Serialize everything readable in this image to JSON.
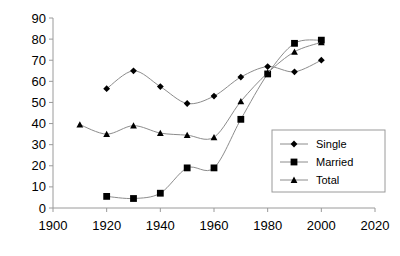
{
  "chart_data": {
    "type": "line",
    "title": "",
    "xlabel": "",
    "ylabel": "",
    "xlim": [
      1900,
      2020
    ],
    "ylim": [
      0,
      90
    ],
    "xticks": [
      1900,
      1920,
      1940,
      1960,
      1980,
      2000,
      2020
    ],
    "yticks": [
      0,
      10,
      20,
      30,
      40,
      50,
      60,
      70,
      80,
      90
    ],
    "xtick_labels": [
      "1900",
      "1920",
      "1940",
      "1960",
      "1980",
      "2000",
      "2020"
    ],
    "ytick_labels": [
      "0",
      "10",
      "20",
      "30",
      "40",
      "50",
      "60",
      "70",
      "80",
      "90"
    ],
    "grid": false,
    "legend_position": "center-right",
    "series": [
      {
        "name": "Single",
        "marker": "diamond",
        "x": [
          1920,
          1930,
          1940,
          1950,
          1960,
          1970,
          1980,
          1990,
          2000
        ],
        "values": [
          56.5,
          65.0,
          57.5,
          49.5,
          53.0,
          62.0,
          67.0,
          64.5,
          70.0
        ]
      },
      {
        "name": "Married",
        "marker": "square",
        "x": [
          1920,
          1930,
          1940,
          1950,
          1960,
          1970,
          1980,
          1990,
          2000
        ],
        "values": [
          5.5,
          4.5,
          7.0,
          19.0,
          19.0,
          42.0,
          63.5,
          78.0,
          79.5
        ]
      },
      {
        "name": "Total",
        "marker": "triangle",
        "x": [
          1910,
          1920,
          1930,
          1940,
          1950,
          1960,
          1970,
          1980,
          1990,
          2000
        ],
        "values": [
          39.5,
          35.0,
          39.0,
          35.5,
          34.5,
          33.5,
          50.5,
          64.0,
          74.0,
          78.5
        ]
      }
    ]
  },
  "legend": {
    "entries": [
      {
        "label": "Single",
        "marker": "diamond"
      },
      {
        "label": "Married",
        "marker": "square"
      },
      {
        "label": "Total",
        "marker": "triangle"
      }
    ]
  }
}
